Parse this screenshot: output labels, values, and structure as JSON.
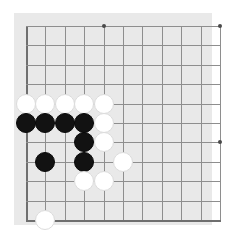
{
  "app": {
    "title": "Go Board",
    "kind": "go-goban-position"
  },
  "board": {
    "style_label": "grayscale",
    "background_color": "#ffffff",
    "surface_color": "#e9e9e9",
    "line_color": "#8e8e8e",
    "edge_line_color": "#6f6f6f",
    "star_point_color": "#4a4a4a",
    "white_stone_color": "#ffffff",
    "black_stone_color": "#121212",
    "origin_x": 12,
    "origin_y": 13,
    "cell_size": 19.4,
    "columns": 11,
    "rows": 11,
    "stone_diameter": 20,
    "star_points": [
      {
        "col": 4,
        "row": 0
      },
      {
        "col": 10,
        "row": 0
      },
      {
        "col": 10,
        "row": 6
      }
    ],
    "vertical_lines": [
      {
        "col": 0,
        "edge": true
      },
      {
        "col": 1,
        "edge": false
      },
      {
        "col": 2,
        "edge": false
      },
      {
        "col": 3,
        "edge": false
      },
      {
        "col": 4,
        "edge": false
      },
      {
        "col": 5,
        "edge": false
      },
      {
        "col": 6,
        "edge": false
      },
      {
        "col": 7,
        "edge": false
      },
      {
        "col": 8,
        "edge": false
      },
      {
        "col": 9,
        "edge": false
      },
      {
        "col": 10,
        "edge": false
      }
    ],
    "horizontal_lines": [
      {
        "row": 0,
        "edge": false
      },
      {
        "row": 1,
        "edge": false
      },
      {
        "row": 2,
        "edge": false
      },
      {
        "row": 3,
        "edge": false
      },
      {
        "row": 4,
        "edge": false
      },
      {
        "row": 5,
        "edge": false
      },
      {
        "row": 6,
        "edge": false
      },
      {
        "row": 7,
        "edge": false
      },
      {
        "row": 8,
        "edge": false
      },
      {
        "row": 9,
        "edge": false
      },
      {
        "row": 10,
        "edge": true
      }
    ]
  },
  "stones": [
    {
      "color": "white",
      "col": 0,
      "row": 4
    },
    {
      "color": "white",
      "col": 1,
      "row": 4
    },
    {
      "color": "white",
      "col": 2,
      "row": 4
    },
    {
      "color": "white",
      "col": 3,
      "row": 4
    },
    {
      "color": "white",
      "col": 4,
      "row": 4
    },
    {
      "color": "black",
      "col": 0,
      "row": 5
    },
    {
      "color": "black",
      "col": 1,
      "row": 5
    },
    {
      "color": "black",
      "col": 2,
      "row": 5
    },
    {
      "color": "black",
      "col": 3,
      "row": 5
    },
    {
      "color": "white",
      "col": 4,
      "row": 5
    },
    {
      "color": "black",
      "col": 3,
      "row": 6
    },
    {
      "color": "white",
      "col": 4,
      "row": 6
    },
    {
      "color": "black",
      "col": 1,
      "row": 7
    },
    {
      "color": "black",
      "col": 3,
      "row": 7
    },
    {
      "color": "white",
      "col": 5,
      "row": 7
    },
    {
      "color": "white",
      "col": 3,
      "row": 8
    },
    {
      "color": "white",
      "col": 4,
      "row": 8
    },
    {
      "color": "white",
      "col": 1,
      "row": 10
    }
  ],
  "counts": {
    "white_stones": 11,
    "black_stones": 7,
    "total_stones": 18
  }
}
